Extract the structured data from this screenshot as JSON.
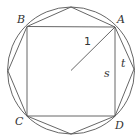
{
  "diagram": {
    "stroke_color": "#555555",
    "text_color": "#333333",
    "circle": {
      "cx": 71,
      "cy": 70.5,
      "r": 63.5
    },
    "center": {
      "x": 71,
      "y": 70.5
    },
    "square": {
      "vertices": {
        "A": [
          115,
          27
        ],
        "B": [
          27,
          26.5
        ],
        "C": [
          27,
          116
        ],
        "D": [
          115,
          116
        ]
      }
    },
    "octagon": {
      "points": "115,27 71,7 27,26.5 8,71 27,116 71,134 115,116 134,69"
    },
    "radius_line": {
      "x1": 71,
      "y1": 70.5,
      "x2": 115,
      "y2": 27
    },
    "labels": {
      "A": {
        "text": "A",
        "x": 117,
        "y": 23
      },
      "B": {
        "text": "B",
        "x": 17,
        "y": 23
      },
      "C": {
        "text": "C",
        "x": 15,
        "y": 125
      },
      "D": {
        "text": "D",
        "x": 115,
        "y": 129
      },
      "radius": {
        "text": "1",
        "x": 84,
        "y": 45
      },
      "s": {
        "text": "s",
        "x": 104,
        "y": 77
      },
      "t": {
        "text": "t",
        "x": 121,
        "y": 67
      }
    }
  }
}
